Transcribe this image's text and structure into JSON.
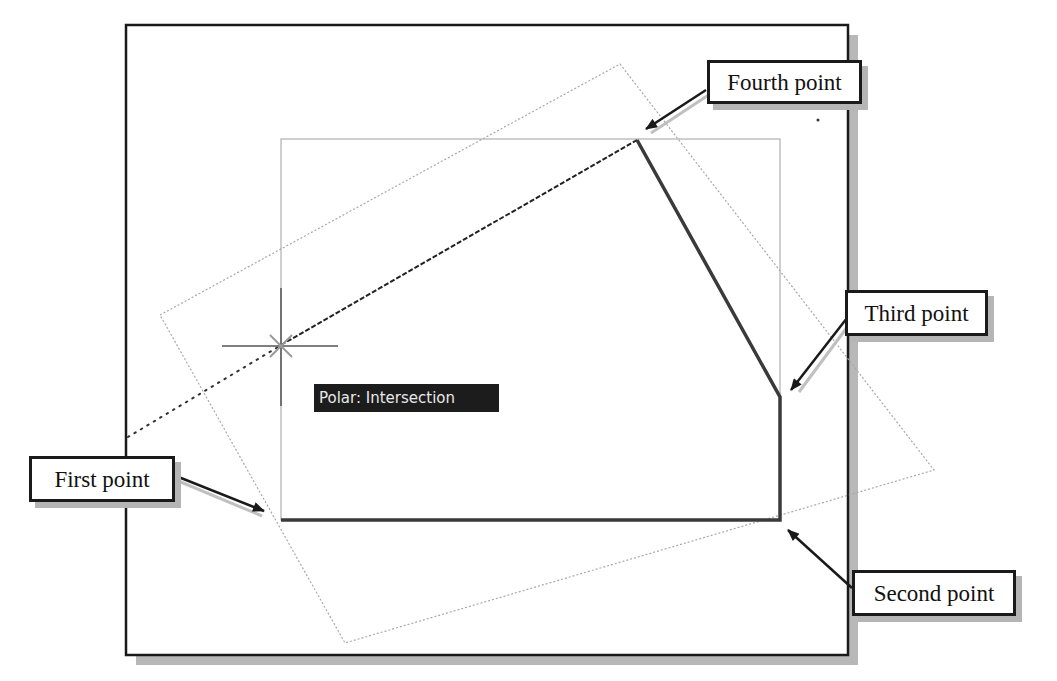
{
  "figure": {
    "type": "CAD drawing illustration (polyline construction with polar tracking)",
    "callouts": [
      {
        "id": "fourth",
        "text": "Fourth point"
      },
      {
        "id": "third",
        "text": "Third point"
      },
      {
        "id": "first",
        "text": "First point"
      },
      {
        "id": "second",
        "text": "Second point"
      }
    ],
    "tooltip": {
      "text": "Polar: Intersection"
    },
    "points": {
      "first": {
        "x": 281,
        "y": 520
      },
      "second": {
        "x": 780,
        "y": 520
      },
      "third": {
        "x": 780,
        "y": 397
      },
      "fourth": {
        "x": 637,
        "y": 140
      },
      "cursor": {
        "x": 281,
        "y": 345
      }
    },
    "colors": {
      "frame": "#1a1a1a",
      "shadow": "#b5b5b5",
      "polyline": "#3a3a3a",
      "construction": "#a8a8a8",
      "tooltip_bg": "#1c1c1c",
      "tooltip_fg": "#e8e8e8"
    }
  }
}
